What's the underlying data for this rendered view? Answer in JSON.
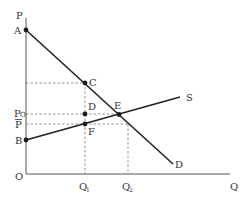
{
  "diagram": {
    "type": "supply-demand",
    "axes": {
      "y_label": "P",
      "x_label": "Q",
      "origin_label": "O"
    },
    "points": {
      "A": "A",
      "B": "B",
      "C": "C",
      "D": "D",
      "E": "E",
      "F": "F"
    },
    "curves": {
      "supply_label": "S",
      "demand_label": "D"
    },
    "price_labels": {
      "p0": "P",
      "p0_sub": "O",
      "pbar": "P"
    },
    "quantity_labels": {
      "q1": "Q",
      "q1_sub": "1",
      "q2": "Q",
      "q2_sub": "2"
    },
    "colors": {
      "line": "#222222",
      "axis": "#555555",
      "guide": "#777777"
    }
  }
}
